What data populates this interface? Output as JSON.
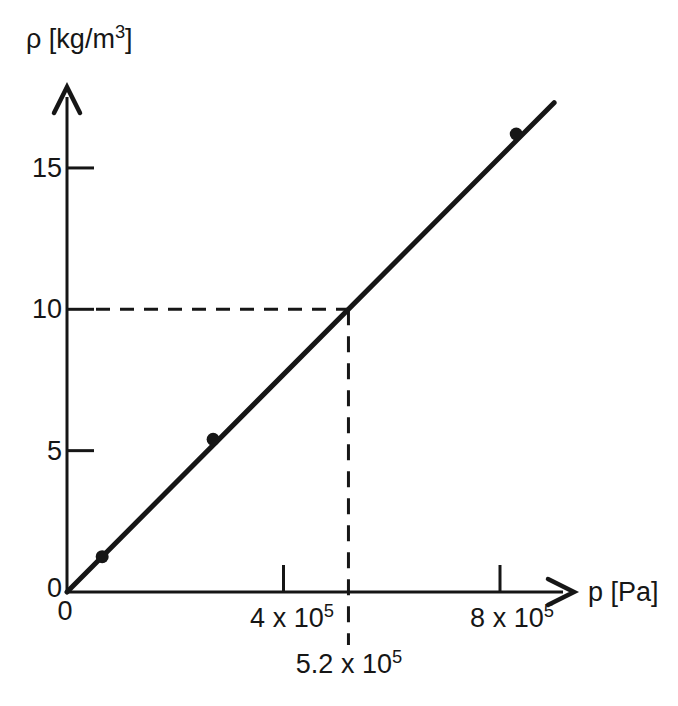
{
  "figure": {
    "background_color": "#ffffff",
    "ink_color": "#161616"
  },
  "y_axis": {
    "title": {
      "pre": "ρ [kg/m",
      "sup": "3",
      "post": "]"
    },
    "ticks": [
      "15",
      "10",
      "5",
      "0"
    ]
  },
  "x_axis": {
    "title": "p [Pa]",
    "origin_label": "0",
    "ticks": [
      {
        "pre": "4 x 10",
        "sup": "5"
      },
      {
        "pre": "8 x 10",
        "sup": "5"
      }
    ]
  },
  "annotation": {
    "pre": "5.2 x 10",
    "sup": "5"
  },
  "chart_data": {
    "type": "line",
    "title": "",
    "xlabel": "p [Pa]",
    "ylabel": "ρ [kg/m³]",
    "xlim": [
      0,
      935000
    ],
    "ylim": [
      0,
      17.8
    ],
    "x_ticks_pa": [
      0,
      400000,
      800000
    ],
    "y_ticks_kg_m3": [
      0,
      5,
      10,
      15
    ],
    "grid": false,
    "legend": false,
    "line": {
      "x_pa": [
        0,
        900000
      ],
      "y_kg_m3": [
        0,
        17.31
      ],
      "through_origin": true,
      "slope_kg_m3_per_pa": 1.923e-05
    },
    "points": [
      {
        "p_pa": 65000,
        "rho_kg_m3": 1.25
      },
      {
        "p_pa": 270000,
        "rho_kg_m3": 5.4
      },
      {
        "p_pa": 830000,
        "rho_kg_m3": 16.2
      }
    ],
    "guide": {
      "p_pa": 520000,
      "rho_kg_m3": 10,
      "style": "dashed"
    }
  }
}
